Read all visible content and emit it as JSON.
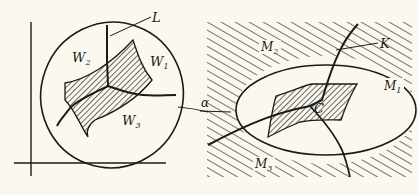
{
  "left_panel": {
    "labels": {
      "L": "L",
      "W1_main": "W",
      "W1_sub": "1",
      "W2_main": "W",
      "W2_sub": "2",
      "W3_main": "W",
      "W3_sub": "3"
    }
  },
  "connector": {
    "alpha": "α"
  },
  "right_panel": {
    "labels": {
      "K": "K",
      "C": "C",
      "M1_main": "M",
      "M1_sub": "1",
      "M2_main": "M",
      "M2_sub": "2",
      "M3_main": "M",
      "M3_sub": "3"
    }
  },
  "colors": {
    "background": "#fbf9ef",
    "ink": "#1a1a1a"
  }
}
